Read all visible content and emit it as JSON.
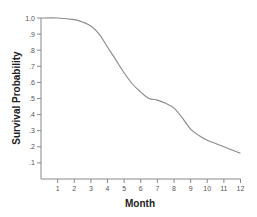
{
  "chart_data": {
    "type": "line",
    "title": "",
    "xlabel": "Month",
    "ylabel": "Survival Probability",
    "xlim": [
      0,
      12
    ],
    "ylim": [
      0,
      1.0
    ],
    "x_ticks": [
      "1",
      "2",
      "3",
      "4",
      "5",
      "6",
      "7",
      "8",
      "9",
      "10",
      "11",
      "12"
    ],
    "y_ticks": [
      "1.0",
      ".9",
      ".8",
      ".7",
      ".6",
      ".5",
      ".4",
      ".3",
      ".2",
      ".1"
    ],
    "grid": false,
    "legend": null,
    "series": [
      {
        "name": "Survival",
        "x": [
          0,
          1,
          2,
          2.5,
          3,
          3.5,
          4,
          4.5,
          5,
          5.5,
          6,
          6.5,
          7,
          7.5,
          8,
          8.5,
          9,
          9.5,
          10,
          10.5,
          11,
          11.5,
          12
        ],
        "values": [
          1.0,
          1.0,
          0.99,
          0.975,
          0.95,
          0.9,
          0.82,
          0.74,
          0.66,
          0.59,
          0.54,
          0.5,
          0.49,
          0.47,
          0.44,
          0.38,
          0.31,
          0.27,
          0.24,
          0.22,
          0.2,
          0.18,
          0.16
        ],
        "color": "#888888"
      }
    ]
  },
  "colors": {
    "axis": "#888888",
    "line": "#8a8a8a"
  }
}
